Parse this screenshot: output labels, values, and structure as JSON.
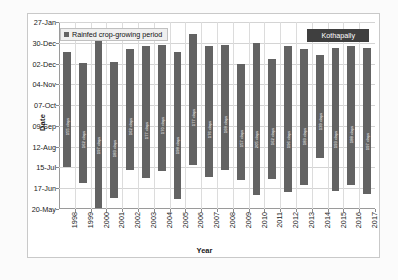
{
  "chart_data": {
    "type": "bar",
    "title": "",
    "site_label": "Kothapally",
    "xlabel": "Year",
    "ylabel": "Date",
    "grid": true,
    "legend_position": "top-left",
    "legend": [
      "Rainfed crop-growing period"
    ],
    "categories": [
      "1998",
      "1999",
      "2000",
      "2001",
      "2002",
      "2003",
      "2004",
      "2005",
      "2006",
      "2007",
      "2008",
      "2009",
      "2010",
      "2011",
      "2012",
      "2013",
      "2014",
      "2015",
      "2016",
      "2017"
    ],
    "ytick_labels": [
      "27-Jan",
      "30-Dec",
      "02-Dec",
      "04-Nov",
      "07-Oct",
      "09-Sep",
      "12-Aug",
      "15-Jul",
      "17-Jun",
      "20-May"
    ],
    "ylim_labels": [
      "20-May",
      "27-Jan"
    ],
    "series": [
      {
        "name": "Rainfed crop-growing period",
        "bar_color": "#636363",
        "value_suffix": "days",
        "values": [
          155,
          162,
          197,
          183,
          162,
          177,
          170,
          198,
          177,
          176,
          168,
          157,
          205,
          162,
          196,
          183,
          139,
          193,
          188,
          197
        ],
        "start_dates": [
          "15-Jul",
          "24-Jun",
          "22-May",
          "04-Jun",
          "12-Jul",
          "01-Jul",
          "10-Jul",
          "03-Jun",
          "18-Jul",
          "02-Jul",
          "12-Jul",
          "28-Jun",
          "08-Jun",
          "29-Jun",
          "12-Jun",
          "21-Jun",
          "28-Jul",
          "13-Jun",
          "21-Jun",
          "09-Jun"
        ],
        "end_dates": [
          "17-Dec",
          "03-Dec",
          "05-Jan",
          "04-Dec",
          "21-Dec",
          "25-Dec",
          "27-Dec",
          "18-Dec",
          "11-Jan",
          "25-Dec",
          "27-Dec",
          "02-Dec",
          "30-Dec",
          "08-Dec",
          "25-Dec",
          "21-Dec",
          "14-Dec",
          "23-Dec",
          "26-Dec",
          "23-Dec"
        ]
      }
    ]
  }
}
